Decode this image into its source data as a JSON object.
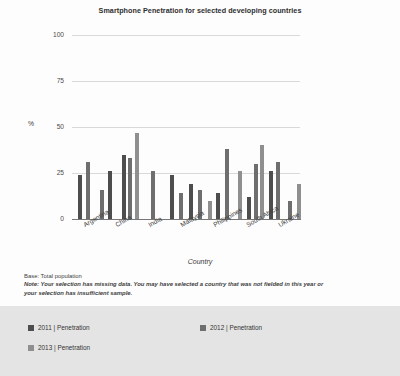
{
  "chart_data": {
    "type": "bar",
    "title": "Smartphone Penetration for selected developing countries",
    "xlabel": "Country",
    "ylabel": "%",
    "ylim": [
      0,
      100
    ],
    "yticks": [
      0,
      25,
      50,
      75,
      100
    ],
    "grid": true,
    "legend_position": "bottom",
    "categories": [
      "Argentina",
      "China",
      "India",
      "Malaysia",
      "Philippines",
      "South Africa",
      "Ukraine"
    ],
    "series": [
      {
        "name": "2011 | Penetration",
        "color": "#4d4d4d",
        "values": [
          24,
          16,
          35,
          null,
          24,
          14,
          23
        ]
      },
      {
        "name": "2012 | Penetration",
        "color": "#6e6e6e",
        "values": [
          31,
          26,
          33,
          16,
          12,
          21,
          13
        ]
      },
      {
        "name": "2013 | Penetration",
        "color": "#8f8f8f",
        "values": [
          null,
          47,
          26,
          38,
          18,
          40,
          null
        ]
      }
    ],
    "bars": [
      {
        "group": "Argentina",
        "series": "2011 | Penetration",
        "value": 24
      },
      {
        "group": "Argentina",
        "series": "2012 | Penetration",
        "value": 31
      },
      {
        "group": "China",
        "series": "2011 | Penetration",
        "value": 16
      },
      {
        "group": "China",
        "series": "2012 | Penetration",
        "value": 26
      },
      {
        "group": "China",
        "series": "2013 | Penetration",
        "value": 35
      },
      {
        "group": "China",
        "series": "2013 | Penetration",
        "value": 33
      },
      {
        "group": "China",
        "series": "2013 | Penetration",
        "value": 47
      },
      {
        "group": "India",
        "series": "2012 | Penetration",
        "value": 26
      },
      {
        "group": "India",
        "series": "2011 | Penetration",
        "value": 24
      },
      {
        "group": "India",
        "series": "2012 | Penetration",
        "value": 14
      },
      {
        "group": "Malaysia",
        "series": "2011 | Penetration",
        "value": 19
      },
      {
        "group": "Malaysia",
        "series": "2012 | Penetration",
        "value": 16
      },
      {
        "group": "Malaysia",
        "series": "2013 | Penetration",
        "value": 38
      },
      {
        "group": "Philippines",
        "series": "2011 | Penetration",
        "value": 14
      },
      {
        "group": "Philippines",
        "series": "2012 | Penetration",
        "value": 38
      },
      {
        "group": "Philippines",
        "series": "2013 | Penetration",
        "value": 26
      },
      {
        "group": "South Africa",
        "series": "2011 | Penetration",
        "value": 12
      },
      {
        "group": "South Africa",
        "series": "2012 | Penetration",
        "value": 30
      },
      {
        "group": "South Africa",
        "series": "2013 | Penetration",
        "value": 40
      },
      {
        "group": "South Africa",
        "series": "2011 | Penetration",
        "value": 26
      },
      {
        "group": "South Africa",
        "series": "2012 | Penetration",
        "value": 31
      },
      {
        "group": "Ukraine",
        "series": "2011 | Penetration",
        "value": 10
      },
      {
        "group": "Ukraine",
        "series": "2013 | Penetration",
        "value": 19
      }
    ]
  },
  "bar_pixels": [
    {
      "x": 6,
      "h": 24,
      "cls": "s2011"
    },
    {
      "x": 14,
      "h": 31,
      "cls": "s2012"
    },
    {
      "x": 28,
      "h": 16,
      "cls": "s2012"
    },
    {
      "x": 36,
      "h": 26,
      "cls": "s2011"
    },
    {
      "x": 50,
      "h": 35,
      "cls": "s2011"
    },
    {
      "x": 56,
      "h": 33,
      "cls": "s2012"
    },
    {
      "x": 63,
      "h": 47,
      "cls": "s2013"
    },
    {
      "x": 79,
      "h": 26,
      "cls": "s2012"
    },
    {
      "x": 98,
      "h": 24,
      "cls": "s2011"
    },
    {
      "x": 107,
      "h": 14,
      "cls": "s2012"
    },
    {
      "x": 117,
      "h": 19,
      "cls": "s2011"
    },
    {
      "x": 126,
      "h": 16,
      "cls": "s2012"
    },
    {
      "x": 136,
      "h": 10,
      "cls": "s2013"
    },
    {
      "x": 144,
      "h": 14,
      "cls": "s2011"
    },
    {
      "x": 153,
      "h": 38,
      "cls": "s2012"
    },
    {
      "x": 166,
      "h": 26,
      "cls": "s2013"
    },
    {
      "x": 175,
      "h": 12,
      "cls": "s2011"
    },
    {
      "x": 182,
      "h": 30,
      "cls": "s2012"
    },
    {
      "x": 188,
      "h": 40,
      "cls": "s2013"
    },
    {
      "x": 197,
      "h": 26,
      "cls": "s2011"
    },
    {
      "x": 204,
      "h": 31,
      "cls": "s2012"
    },
    {
      "x": 216,
      "h": 10,
      "cls": "s2012"
    },
    {
      "x": 225,
      "h": 19,
      "cls": "s2013"
    }
  ],
  "footnotes": {
    "base": "Base: Total population",
    "note": "Note: Your selection has missing data. You may have selected a country that was not fielded in this year or your selection has insufficient sample."
  },
  "legend": {
    "items": [
      {
        "label": "2011 | Penetration",
        "color": "#4d4d4d"
      },
      {
        "label": "2012 | Penetration",
        "color": "#6e6e6e"
      },
      {
        "label": "2013 | Penetration",
        "color": "#8f8f8f"
      }
    ]
  }
}
